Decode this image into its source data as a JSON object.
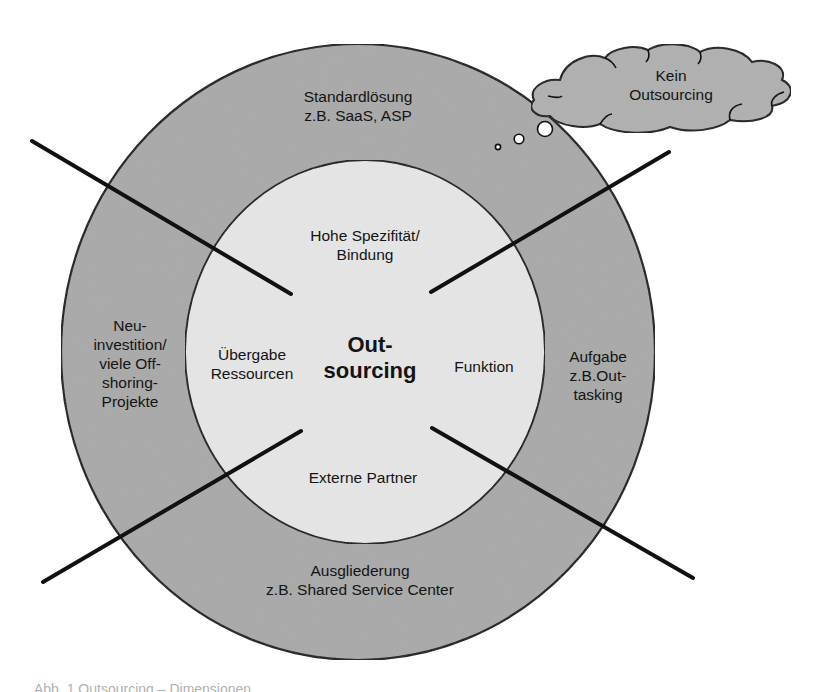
{
  "diagram": {
    "colors": {
      "background": "#ffffff",
      "outer_ring_fill": "#a9a9a9",
      "inner_circle_fill": "#e6e6e6",
      "cloud_fill": "#b0b0b0",
      "stroke": "#111111"
    },
    "center": {
      "label": "Out-\nsourcing"
    },
    "inner_circle": {
      "top": "Hohe Spezifität/\nBindung",
      "left": "Übergabe\nRessourcen",
      "right": "Funktion",
      "bottom": "Externe Partner"
    },
    "outer_ring": {
      "top": "Standardlösung\nz.B. SaaS, ASP",
      "left": "Neu-\ninvestition/\nviele Off-\nshoring-\nProjekte",
      "right": "Aufgabe\nz.B.Out-\ntasking",
      "bottom": "Ausgliederung\nz.B. Shared Service Center"
    },
    "thought_cloud": {
      "label": "Kein\nOutsourcing"
    },
    "caption": {
      "text": "Abb. 1 Outsourcing – Dimensionen"
    }
  }
}
